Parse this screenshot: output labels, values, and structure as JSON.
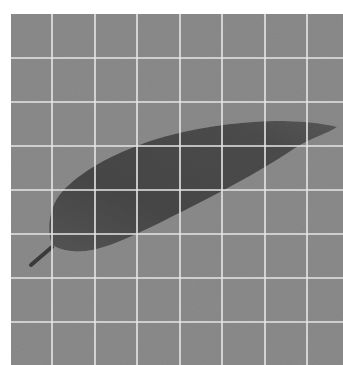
{
  "image": {
    "subject": "leaf on grid background",
    "colors": {
      "page_background": "#ffffff",
      "grid_background": "#8b8b8b",
      "grid_lines": "#e6e6e6",
      "leaf_fill": "#4a4a4a",
      "leaf_edge": "#5e5e5e",
      "stem": "#3a3a3a"
    },
    "grid": {
      "vertical_lines_x": [
        52,
        95,
        137,
        180,
        222,
        265,
        307
      ],
      "horizontal_lines_y": [
        58,
        102,
        146,
        190,
        234,
        278,
        322
      ]
    }
  }
}
